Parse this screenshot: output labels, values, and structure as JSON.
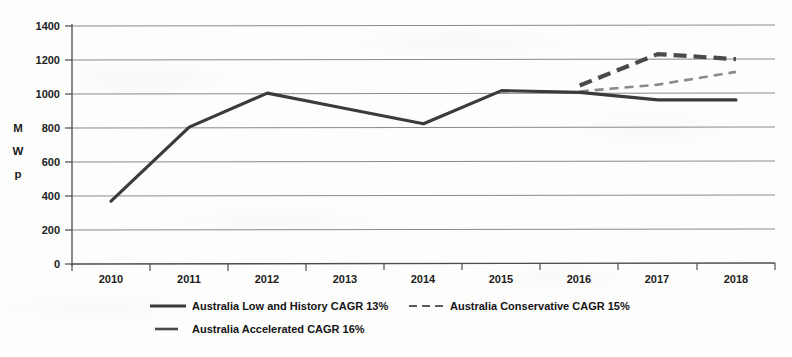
{
  "chart_data": {
    "type": "line",
    "title": "",
    "xlabel": "",
    "ylabel": "MWp",
    "ylabel_chars": [
      "M",
      "W",
      "p"
    ],
    "categories": [
      "2010",
      "2011",
      "2012",
      "2013",
      "2014",
      "2015",
      "2016",
      "2017",
      "2018"
    ],
    "ylim": [
      0,
      1400
    ],
    "yticks": [
      "0",
      "200",
      "400",
      "600",
      "800",
      "1000",
      "1200",
      "1400"
    ],
    "ytick_values": [
      0,
      200,
      400,
      600,
      800,
      1000,
      1200,
      1400
    ],
    "grid": true,
    "legend_position": "bottom",
    "series": [
      {
        "name": "Australia Low and History CAGR 13%",
        "style": "solid",
        "color": "#3b3b3b",
        "width": 3.2,
        "values": [
          370,
          805,
          1005,
          915,
          825,
          1020,
          1010,
          965,
          965
        ]
      },
      {
        "name": "Australia Conservative CAGR 15%",
        "style": "dashed",
        "color": "#8a8a8a",
        "width": 2.6,
        "values": [
          null,
          null,
          null,
          null,
          null,
          null,
          1015,
          1055,
          1130
        ]
      },
      {
        "name": "Australia Accelerated CAGR 16%",
        "style": "dashed",
        "color": "#4a4a4a",
        "width": 4.2,
        "values": [
          null,
          null,
          null,
          null,
          null,
          null,
          1050,
          1235,
          1205
        ]
      }
    ]
  },
  "legend": {
    "items": [
      {
        "label": "Australia Low and History CAGR 13%",
        "marker": "solid-line-marker"
      },
      {
        "label": "Australia Conservative CAGR 15%",
        "marker": "dashed-line-marker"
      },
      {
        "label": "Australia Accelerated CAGR 16%",
        "marker": "short-dash-line-marker"
      }
    ]
  },
  "colors": {
    "axis": "#4d4d4d",
    "grid": "#7d7d7d",
    "text": "#1c1c1c",
    "background": "#fdfdfc"
  }
}
